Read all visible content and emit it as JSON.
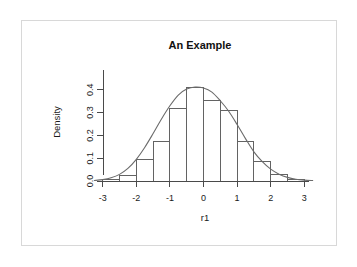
{
  "figure": {
    "background_color": "#ffffff",
    "border_color": "#d8d8d8",
    "axis_color": "#4a4a4a",
    "bar_stroke_color": "#636363",
    "bar_fill_color": "#ffffff",
    "density_line_color": "#6b6b6b"
  },
  "chart_data": {
    "type": "bar",
    "title": "An Example",
    "subtitle": "",
    "xlabel": "r1",
    "ylabel": "Density",
    "grid": false,
    "legend": null,
    "xlim": [
      -3.25,
      3.25
    ],
    "ylim": [
      0.0,
      0.43
    ],
    "xticks": [
      -3,
      -2,
      -1,
      0,
      1,
      2,
      3
    ],
    "xtick_labels": [
      "-3",
      "-2",
      "-1",
      "0",
      "1",
      "2",
      "3"
    ],
    "yticks": [
      0.0,
      0.1,
      0.2,
      0.3,
      0.4
    ],
    "ytick_labels": [
      "0.0",
      "0.1",
      "0.2",
      "0.3",
      "0.4"
    ],
    "bin_width": 0.5,
    "bin_edges": [
      -3.0,
      -2.5,
      -2.0,
      -1.5,
      -1.0,
      -0.5,
      0.0,
      0.5,
      1.0,
      1.5,
      2.0,
      2.5,
      3.0
    ],
    "categories": [
      "-3.0--2.5",
      "-2.5--2.0",
      "-2.0--1.5",
      "-1.5--1.0",
      "-1.0--0.5",
      "-0.5-0.0",
      "0.0-0.5",
      "0.5-1.0",
      "1.0-1.5",
      "1.5-2.0",
      "2.0-2.5",
      "2.5-3.0"
    ],
    "values": [
      0.005,
      0.022,
      0.093,
      0.172,
      0.32,
      0.41,
      0.355,
      0.308,
      0.175,
      0.085,
      0.03,
      0.008
    ],
    "series": [
      {
        "name": "Density",
        "type": "line",
        "x": [
          -3.25,
          -3.0,
          -2.75,
          -2.5,
          -2.25,
          -2.0,
          -1.75,
          -1.5,
          -1.25,
          -1.0,
          -0.75,
          -0.5,
          -0.25,
          0.0,
          0.25,
          0.5,
          0.75,
          1.0,
          1.25,
          1.5,
          1.75,
          2.0,
          2.25,
          2.5,
          2.75,
          3.0,
          3.25
        ],
        "values": [
          0.002,
          0.006,
          0.014,
          0.029,
          0.055,
          0.095,
          0.147,
          0.208,
          0.272,
          0.33,
          0.377,
          0.403,
          0.412,
          0.408,
          0.39,
          0.352,
          0.306,
          0.248,
          0.186,
          0.128,
          0.085,
          0.052,
          0.03,
          0.016,
          0.008,
          0.004,
          0.002
        ]
      }
    ]
  }
}
